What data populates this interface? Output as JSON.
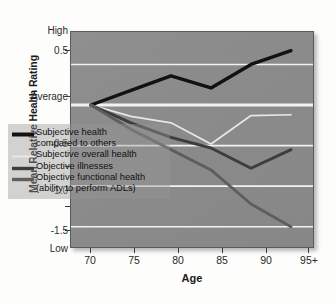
{
  "chart_data": {
    "type": "line",
    "title": "",
    "xlabel": "Age",
    "ylabel": "Mean Relative Health Rating",
    "categories": [
      "70",
      "75",
      "80",
      "85",
      "90",
      "95+"
    ],
    "x": [
      70,
      75,
      80,
      85,
      90,
      95
    ],
    "ylim": [
      -1.75,
      0.9
    ],
    "grid": true,
    "grid_color": "#f2f2f0",
    "plot_background": "#8b8b8b",
    "legend_position": "inside-lower-left",
    "y_tick_labels": [
      "High",
      "0.5",
      "Average",
      "-0.5",
      "-1.0",
      "-1.5",
      "Low"
    ],
    "y_tick_values": [
      0.9,
      0.5,
      0.0,
      -0.5,
      -1.0,
      -1.5,
      -1.75
    ],
    "series": [
      {
        "name": "Subjective health\ncompared to others",
        "legend_label": "Subjective health\ncompared to others",
        "color": "#121212",
        "width": 3.4,
        "values": [
          0.0,
          0.18,
          0.36,
          0.21,
          0.5,
          0.67
        ]
      },
      {
        "name": "Subjective overall health",
        "legend_label": "Subjective overall health",
        "color": "#e8e8e2",
        "width": 1.7,
        "values": [
          0.0,
          -0.14,
          -0.22,
          -0.48,
          -0.13,
          -0.12
        ]
      },
      {
        "name": "Objective illnesses",
        "legend_label": "Objective illnesses",
        "color": "#3d3d3d",
        "width": 2.9,
        "values": [
          0.0,
          -0.22,
          -0.4,
          -0.53,
          -0.78,
          -0.55
        ]
      },
      {
        "name": "Objective functional health\n(ability to perform ADLs)",
        "legend_label": "Objective functional health\n(ability to perform ADLs)",
        "color": "#5e5e5e",
        "width": 2.9,
        "values": [
          0.0,
          -0.3,
          -0.55,
          -0.8,
          -1.22,
          -1.5
        ]
      }
    ]
  },
  "axes": {
    "y_title": "Mean Relative Health Rating",
    "x_title": "Age",
    "y_labels": {
      "high": "High",
      "p05": "0.5",
      "average": "Average",
      "n05": "-0.5",
      "n10": "-1.0",
      "n15": "-1.5",
      "low": "Low"
    },
    "x_labels": [
      "70",
      "75",
      "80",
      "85",
      "90",
      "95+"
    ]
  },
  "legend": {
    "items": [
      {
        "label": "Subjective health\ncompared to others",
        "color": "#121212"
      },
      {
        "label": "Subjective overall health",
        "color": "#e8e8e2"
      },
      {
        "label": "Objective illnesses",
        "color": "#3d3d3d"
      },
      {
        "label": "Objective functional health\n(ability to perform ADLs)",
        "color": "#5e5e5e"
      }
    ]
  }
}
